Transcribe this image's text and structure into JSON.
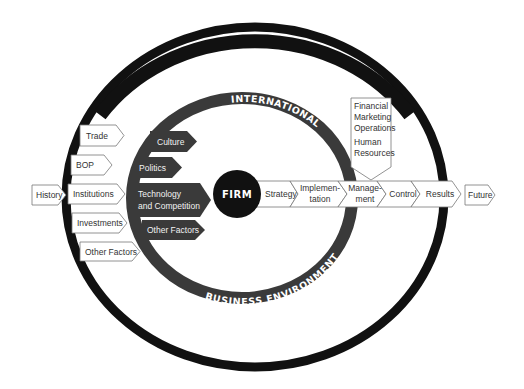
{
  "diagram": {
    "outer_ring": {
      "label": "GLOBAL ECONOMIC ENVIRONMENT",
      "color": "#111111"
    },
    "inner_ring": {
      "label_top": "INTERNATIONAL",
      "label_bottom": "BUSINESS ENVIRONMENT",
      "color": "#3a3a3a"
    },
    "center": {
      "label": "FIRM",
      "color": "#111111"
    },
    "global_factors": [
      {
        "label": "Trade"
      },
      {
        "label": "BOP"
      },
      {
        "label": "Institutions"
      },
      {
        "label": "Investments"
      },
      {
        "label": "Other Factors"
      }
    ],
    "business_factors": [
      {
        "label": "Culture"
      },
      {
        "label": "Politics"
      },
      {
        "label": "Technology",
        "label2": "and Competition"
      },
      {
        "label": "Other Factors"
      }
    ],
    "entry": {
      "label": "History"
    },
    "process_chain": [
      {
        "label": "Strategy"
      },
      {
        "label": "Implemen-",
        "label2": "tation"
      },
      {
        "label": "Manage-",
        "label2": "ment"
      },
      {
        "label": "Control"
      },
      {
        "label": "Results"
      }
    ],
    "exit": {
      "label": "Future"
    },
    "management_callout": {
      "lines": [
        "Financial",
        "Marketing",
        "Operations",
        "Human",
        "Resources"
      ]
    }
  }
}
